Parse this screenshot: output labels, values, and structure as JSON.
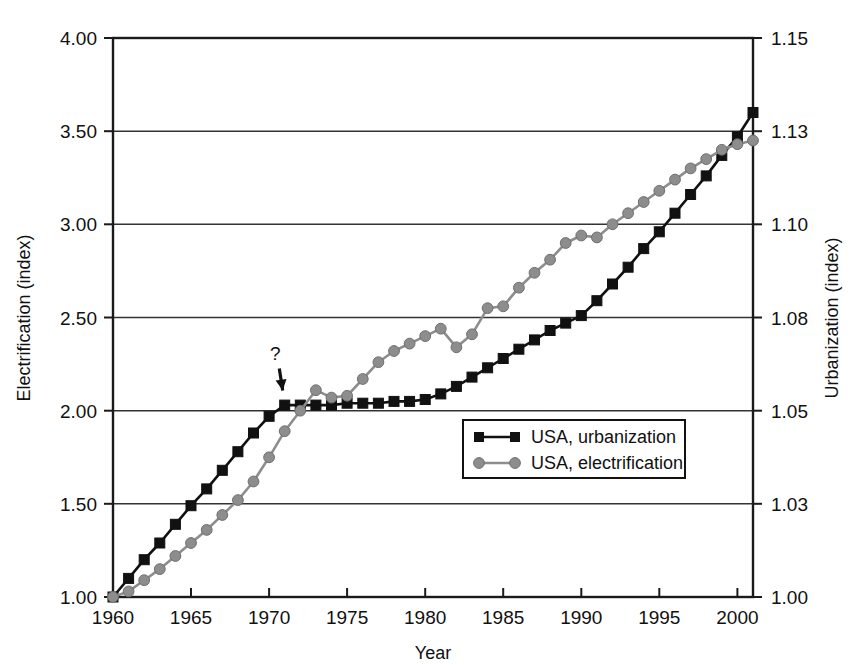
{
  "chart_data": {
    "type": "line",
    "title": "",
    "xlabel": "Year",
    "ylabel": "Electrification (index)",
    "y2label": "Urbanization (index)",
    "xlim": [
      1960,
      2001
    ],
    "ylim": [
      1.0,
      4.0
    ],
    "y2lim": [
      1.0,
      1.15
    ],
    "grid": true,
    "legend_position": "center-right-inside",
    "x_tick_labels": [
      "1960",
      "1965",
      "1970",
      "1975",
      "1980",
      "1985",
      "1990",
      "1995",
      "2000"
    ],
    "x_ticks": [
      1960,
      1965,
      1970,
      1975,
      1980,
      1985,
      1990,
      1995,
      2000
    ],
    "y_tick_labels": [
      "1.00",
      "1.50",
      "2.00",
      "2.50",
      "3.00",
      "3.50",
      "4.00"
    ],
    "y_ticks": [
      1.0,
      1.5,
      2.0,
      2.5,
      3.0,
      3.5,
      4.0
    ],
    "y2_tick_labels": [
      "1.00",
      "1.03",
      "1.05",
      "1.08",
      "1.10",
      "1.13",
      "1.15"
    ],
    "y2_ticks": [
      1.0,
      1.5,
      2.0,
      2.5,
      3.0,
      3.5,
      4.0
    ],
    "annotations": [
      {
        "text": "?",
        "x": 1970.4,
        "y": 2.27,
        "arrow_to_x": 1971.0,
        "arrow_to_y": 2.07
      }
    ],
    "colors": {
      "urbanization": "#111111",
      "electrification": "#8d8d8d",
      "frame": "#1a1a1a",
      "grid": "#333333"
    },
    "x": [
      1960,
      1961,
      1962,
      1963,
      1964,
      1965,
      1966,
      1967,
      1968,
      1969,
      1970,
      1971,
      1972,
      1973,
      1974,
      1975,
      1976,
      1977,
      1978,
      1979,
      1980,
      1981,
      1982,
      1983,
      1984,
      1985,
      1986,
      1987,
      1988,
      1989,
      1990,
      1991,
      1992,
      1993,
      1994,
      1995,
      1996,
      1997,
      1998,
      1999,
      2000,
      2001
    ],
    "series": [
      {
        "name": "USA, urbanization",
        "marker": "square",
        "color": "#111111",
        "axis": "right",
        "values": [
          1.0,
          1.1,
          1.2,
          1.29,
          1.39,
          1.49,
          1.58,
          1.68,
          1.78,
          1.88,
          1.97,
          2.03,
          2.03,
          2.03,
          2.03,
          2.04,
          2.04,
          2.04,
          2.05,
          2.05,
          2.06,
          2.09,
          2.13,
          2.18,
          2.23,
          2.28,
          2.33,
          2.38,
          2.43,
          2.47,
          2.51,
          2.59,
          2.68,
          2.77,
          2.87,
          2.96,
          3.06,
          3.16,
          3.26,
          3.37,
          3.47,
          3.6
        ]
      },
      {
        "name": "USA, electrification",
        "marker": "circle",
        "color": "#8d8d8d",
        "axis": "left",
        "values": [
          1.0,
          1.03,
          1.09,
          1.15,
          1.22,
          1.29,
          1.36,
          1.44,
          1.52,
          1.62,
          1.75,
          1.89,
          2.0,
          2.11,
          2.07,
          2.08,
          2.17,
          2.26,
          2.32,
          2.36,
          2.4,
          2.44,
          2.34,
          2.41,
          2.55,
          2.56,
          2.66,
          2.74,
          2.81,
          2.9,
          2.94,
          2.93,
          3.0,
          3.06,
          3.12,
          3.18,
          3.24,
          3.3,
          3.35,
          3.4,
          3.43,
          3.45
        ]
      }
    ]
  },
  "axes": {
    "left_title": "Electrification (index)",
    "right_title": "Urbanization (index)",
    "bottom_title": "Year"
  },
  "legend": {
    "items": [
      {
        "label": "USA, urbanization",
        "marker": "square",
        "color": "#111111"
      },
      {
        "label": "USA, electrification",
        "marker": "circle",
        "color": "#8d8d8d"
      }
    ]
  },
  "annotation": {
    "question_mark": "?"
  }
}
